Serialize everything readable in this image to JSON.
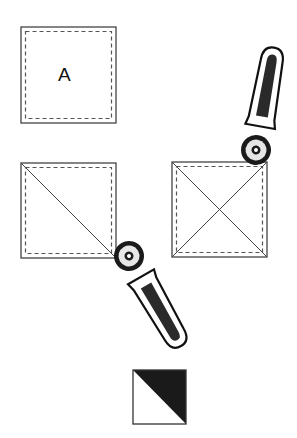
{
  "diagram": {
    "type": "rotary-cutting-half-square-triangle-steps",
    "colors": {
      "line": "#333333",
      "dashed": "#555555",
      "handle_fill": "#2a2a2a",
      "fill_dark": "#1a1a1a",
      "background": "#ffffff"
    },
    "squares": [
      {
        "id": "square-a",
        "label": "A",
        "x": 21,
        "y": 27,
        "size": 95,
        "cuts": []
      },
      {
        "id": "square-diagonal-cut",
        "label": "",
        "x": 21,
        "y": 163,
        "size": 95,
        "cuts": [
          "top-left-to-bottom-right"
        ]
      },
      {
        "id": "square-x-cut",
        "label": "",
        "x": 172,
        "y": 162,
        "size": 95,
        "cuts": [
          "top-left-to-bottom-right",
          "bottom-left-to-top-right"
        ]
      }
    ],
    "cutters": [
      {
        "id": "cutter-top-right",
        "wheel": [
          256,
          150
        ],
        "icon": "rotary-cutter-icon"
      },
      {
        "id": "cutter-bottom",
        "wheel": [
          129,
          256
        ],
        "icon": "rotary-cutter-icon"
      }
    ],
    "result": {
      "id": "half-square-triangle",
      "x": 133,
      "y": 370,
      "size": 53,
      "dark_half": "top-right"
    }
  }
}
